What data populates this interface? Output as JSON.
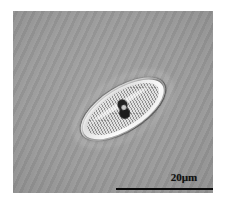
{
  "figure": {
    "kind": "light-micrograph",
    "background_color": "#9a9a9a",
    "border_color": "#ffffff"
  },
  "micrograph": {
    "specimen_name": "diatom-valve",
    "inclusion_name": "central-nodule",
    "outline_color": "#3a3a3a",
    "silica_color": "#f4f4f4",
    "face_color": "#c9c9c9",
    "nodule_color": "#101010"
  },
  "scale_bar": {
    "label": "20µm",
    "length_um": 20,
    "line_color": "#0a0a0a",
    "line_length_px": 104,
    "line_thickness_px": 2
  }
}
